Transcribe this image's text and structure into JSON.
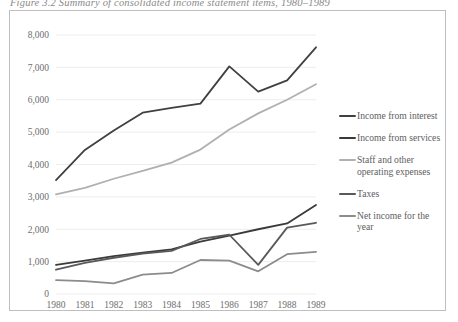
{
  "figure": {
    "caption": "Figure 3.2  Summary of consolidated income statement items, 1980–1989"
  },
  "legend": {
    "position": "right",
    "items": [
      {
        "label": "Income from interest",
        "color": "#404040"
      },
      {
        "label": "Income from services",
        "color": "#3a3a3a"
      },
      {
        "label": "Staff and other operating expenses",
        "color": "#b0b0b0"
      },
      {
        "label": "Taxes",
        "color": "#595959"
      },
      {
        "label": "Net income for the year",
        "color": "#8c8c8c"
      }
    ]
  },
  "chart_data": {
    "type": "line",
    "title": "",
    "xlabel": "",
    "ylabel": "",
    "grid": true,
    "legend_position": "right",
    "categories": [
      "1980",
      "1981",
      "1982",
      "1983",
      "1984",
      "1985",
      "1986",
      "1987",
      "1988",
      "1989"
    ],
    "x": [
      1980,
      1981,
      1982,
      1983,
      1984,
      1985,
      1986,
      1987,
      1988,
      1989
    ],
    "xlim": [
      1980,
      1989
    ],
    "ylim": [
      0,
      8000
    ],
    "ytick_labels": [
      "0",
      "1,000",
      "2,000",
      "3,000",
      "4,000",
      "5,000",
      "6,000",
      "7,000",
      "8,000"
    ],
    "ytick_values": [
      0,
      1000,
      2000,
      3000,
      4000,
      5000,
      6000,
      7000,
      8000
    ],
    "series": [
      {
        "name": "Income from interest",
        "color": "#404040",
        "width": 1.8,
        "values": [
          3520,
          4450,
          5050,
          5600,
          5750,
          5880,
          7030,
          6250,
          6600,
          7620
        ]
      },
      {
        "name": "Income from services",
        "color": "#3a3a3a",
        "width": 1.8,
        "values": [
          900,
          1030,
          1170,
          1280,
          1380,
          1620,
          1800,
          2000,
          2180,
          2750
        ]
      },
      {
        "name": "Staff and other operating expenses",
        "color": "#b0b0b0",
        "width": 1.8,
        "values": [
          3080,
          3280,
          3560,
          3800,
          4060,
          4460,
          5080,
          5580,
          6000,
          6480
        ]
      },
      {
        "name": "Taxes",
        "color": "#595959",
        "width": 1.8,
        "values": [
          750,
          960,
          1120,
          1250,
          1330,
          1700,
          1830,
          900,
          2050,
          2200
        ]
      },
      {
        "name": "Net income for the year",
        "color": "#8c8c8c",
        "width": 1.8,
        "values": [
          430,
          400,
          330,
          600,
          650,
          1050,
          1030,
          700,
          1230,
          1300
        ]
      }
    ]
  }
}
